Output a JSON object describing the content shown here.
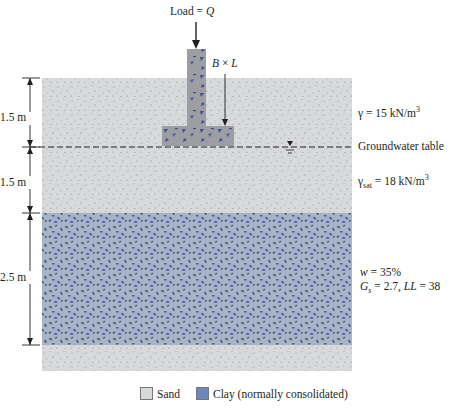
{
  "load": {
    "text_prefix": "Load = ",
    "symbol": "Q"
  },
  "footing": {
    "label_b": "B",
    "times": " × ",
    "label_l": "L"
  },
  "dimensions": [
    {
      "value": "1.5 m"
    },
    {
      "value": "1.5 m"
    },
    {
      "value": "2.5 m"
    }
  ],
  "layers": {
    "sand_top": {
      "gamma_symbol": "γ",
      "gamma_eq": " = 15 kN/m",
      "gamma_exp": "3"
    },
    "gwt": {
      "label": "Groundwater table"
    },
    "sand_sat": {
      "gamma_symbol": "γ",
      "gamma_sub": "sat",
      "gamma_eq": " = 18 kN/m",
      "gamma_exp": "3"
    },
    "clay": {
      "w_symbol": "w",
      "w_eq": " = 35%",
      "gs_symbol": "G",
      "gs_sub": "s",
      "gs_eq": " = 2.7, ",
      "ll_symbol": "LL",
      "ll_eq": " = 38"
    }
  },
  "legend": {
    "sand": "Sand",
    "clay": "Clay (normally consolidated)"
  },
  "colors": {
    "sand": "#d6d8da",
    "clay_bg": "#a9b3c4",
    "clay_fleck": "#2f56a8",
    "footing": "#9a9ca0",
    "text": "#231f20"
  }
}
